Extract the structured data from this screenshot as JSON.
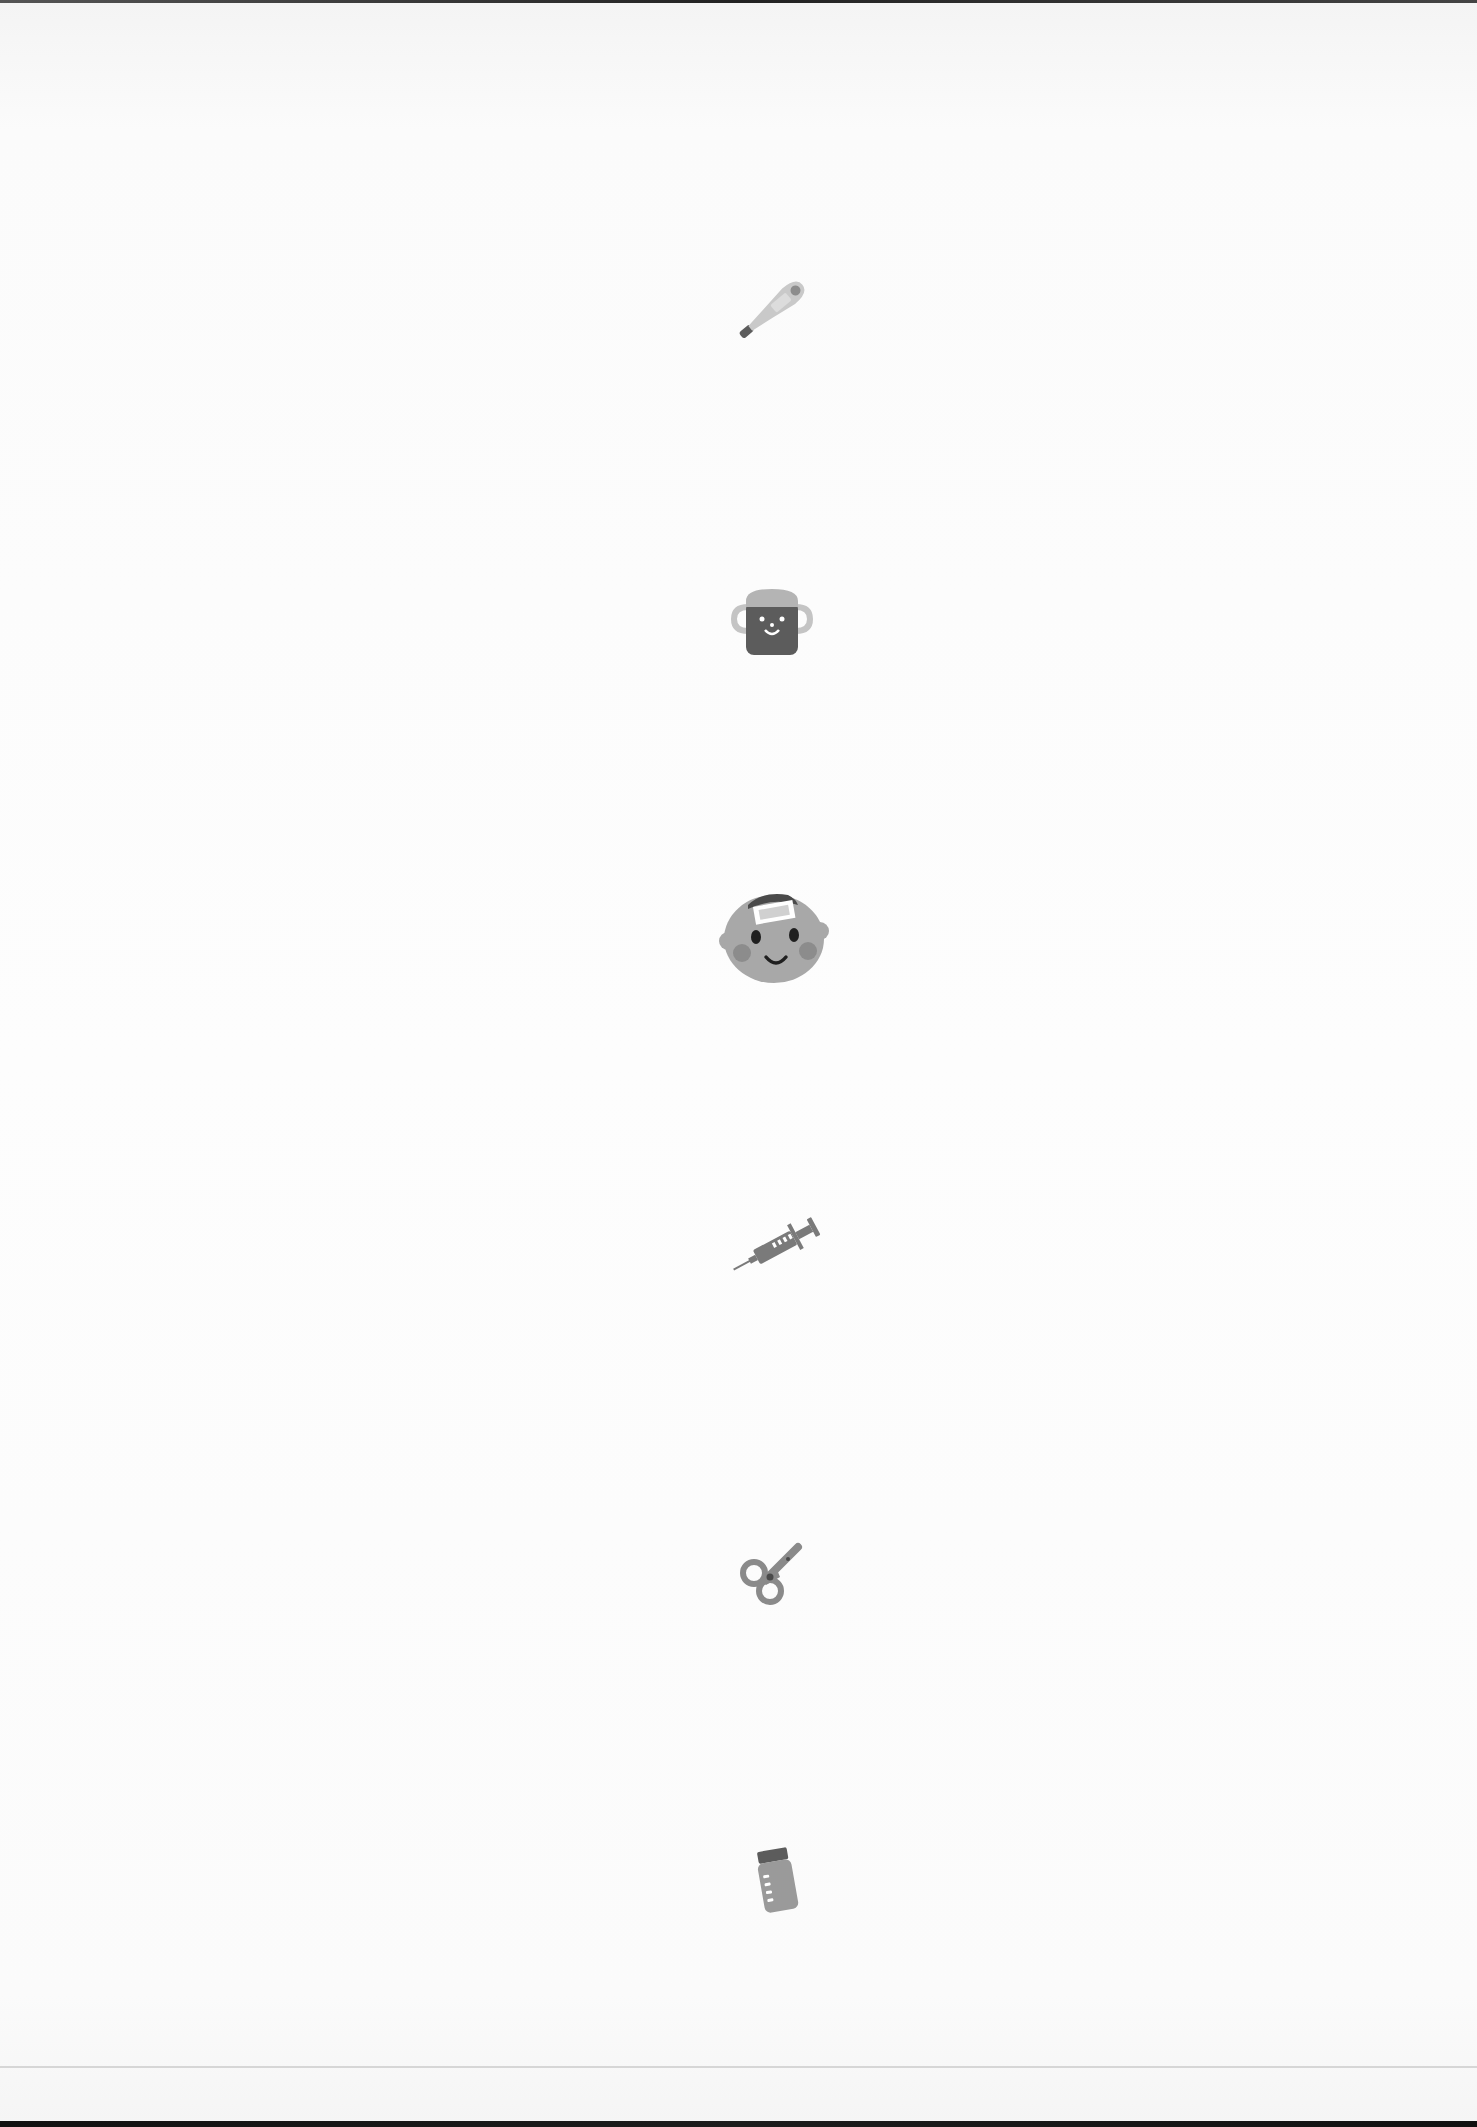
{
  "document": {
    "type": "scanned page",
    "background_color": "#fdfdfd",
    "rule_color": "#d6d6d6"
  },
  "illustrations": [
    {
      "name": "thermometer-icon",
      "label": "Thermometer",
      "x": 726,
      "y": 266,
      "w": 90,
      "h": 84
    },
    {
      "name": "sippy-cup-icon",
      "label": "Sippy cup",
      "x": 728,
      "y": 582,
      "w": 88,
      "h": 72
    },
    {
      "name": "baby-face-fever-patch-icon",
      "label": "Baby with fever patch",
      "x": 714,
      "y": 884,
      "w": 120,
      "h": 96
    },
    {
      "name": "syringe-icon",
      "label": "Syringe",
      "x": 726,
      "y": 1208,
      "w": 100,
      "h": 72
    },
    {
      "name": "baby-scissors-icon",
      "label": "Baby scissors",
      "x": 736,
      "y": 1536,
      "w": 72,
      "h": 72
    },
    {
      "name": "medicine-bottle-icon",
      "label": "Medicine bottle",
      "x": 752,
      "y": 1842,
      "w": 52,
      "h": 70
    }
  ],
  "colors": {
    "light_gray": "#c9c9c9",
    "mid_gray": "#9a9a9a",
    "dark_gray": "#5c5c5c",
    "darker_gray": "#4a4a4a",
    "white": "#ffffff"
  }
}
